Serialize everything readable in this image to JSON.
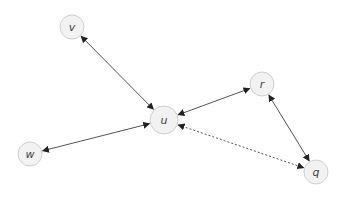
{
  "diagram": {
    "type": "directed-graph",
    "colors": {
      "node_fill": "#f2f2f2",
      "node_stroke": "#cfcfcf",
      "edge": "#555555",
      "label": "#444444"
    },
    "nodes": [
      {
        "id": "v",
        "label": "v",
        "x": 72,
        "y": 27,
        "r": 12
      },
      {
        "id": "u",
        "label": "u",
        "x": 164,
        "y": 120,
        "r": 14
      },
      {
        "id": "r",
        "label": "r",
        "x": 262,
        "y": 84,
        "r": 12
      },
      {
        "id": "q",
        "label": "q",
        "x": 316,
        "y": 172,
        "r": 12
      },
      {
        "id": "w",
        "label": "w",
        "x": 30,
        "y": 154,
        "r": 12
      }
    ],
    "edges": [
      {
        "from": "v",
        "to": "u",
        "style": "solid",
        "direction": "both"
      },
      {
        "from": "u",
        "to": "r",
        "style": "solid",
        "direction": "both"
      },
      {
        "from": "r",
        "to": "q",
        "style": "solid",
        "direction": "both"
      },
      {
        "from": "w",
        "to": "u",
        "style": "solid",
        "direction": "both"
      },
      {
        "from": "u",
        "to": "q",
        "style": "dotted",
        "direction": "both"
      }
    ]
  }
}
